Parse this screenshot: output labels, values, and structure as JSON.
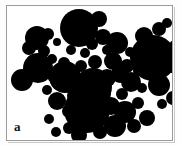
{
  "figure": {
    "panel_label": "a",
    "background_color": "#ffffff",
    "particle_color": "#000000",
    "frame_color": "#9a9a9a",
    "outer_background": "#fdfdfd",
    "frame": {
      "x": 6,
      "y": 5,
      "width": 167,
      "height": 136
    }
  },
  "chart_data": {
    "type": "scatter",
    "title": "",
    "subtitle": "",
    "xlabel": "",
    "ylabel": "",
    "xlim": [
      0,
      165
    ],
    "ylim": [
      0,
      134
    ],
    "grid": false,
    "legend": null,
    "annotations": [
      "a"
    ],
    "marker_color": "#000000",
    "count": 58,
    "series": [
      {
        "name": "particles",
        "fields": [
          "cx",
          "cy",
          "r"
        ],
        "points": [
          [
            72,
            22,
            19
          ],
          [
            92,
            13,
            8
          ],
          [
            96,
            31,
            8
          ],
          [
            85,
            38,
            6
          ],
          [
            100,
            44,
            5
          ],
          [
            110,
            37,
            11
          ],
          [
            106,
            55,
            9
          ],
          [
            120,
            60,
            7
          ],
          [
            30,
            32,
            12
          ],
          [
            41,
            28,
            6
          ],
          [
            22,
            42,
            7
          ],
          [
            37,
            45,
            6
          ],
          [
            45,
            53,
            5
          ],
          [
            31,
            62,
            15
          ],
          [
            15,
            74,
            11
          ],
          [
            46,
            70,
            6
          ],
          [
            57,
            57,
            6
          ],
          [
            58,
            71,
            16
          ],
          [
            137,
            30,
            9
          ],
          [
            152,
            23,
            7
          ],
          [
            160,
            17,
            5
          ],
          [
            146,
            52,
            23
          ],
          [
            123,
            46,
            5
          ],
          [
            168,
            40,
            6
          ],
          [
            164,
            60,
            7
          ],
          [
            152,
            79,
            11
          ],
          [
            166,
            92,
            7
          ],
          [
            135,
            82,
            5
          ],
          [
            124,
            76,
            10
          ],
          [
            113,
            68,
            9
          ],
          [
            100,
            72,
            9
          ],
          [
            86,
            81,
            19
          ],
          [
            68,
            90,
            8
          ],
          [
            50,
            95,
            9
          ],
          [
            80,
            104,
            23
          ],
          [
            104,
            100,
            9
          ],
          [
            118,
            106,
            11
          ],
          [
            131,
            97,
            6
          ],
          [
            140,
            112,
            8
          ],
          [
            127,
            120,
            7
          ],
          [
            108,
            120,
            11
          ],
          [
            93,
            126,
            7
          ],
          [
            72,
            129,
            8
          ],
          [
            62,
            122,
            6
          ],
          [
            49,
            126,
            5
          ],
          [
            42,
            113,
            5
          ],
          [
            64,
            44,
            5
          ],
          [
            50,
            36,
            4
          ],
          [
            88,
            56,
            7
          ],
          [
            74,
            60,
            6
          ],
          [
            131,
            65,
            5
          ],
          [
            96,
            88,
            8
          ],
          [
            62,
            105,
            7
          ],
          [
            25,
            54,
            5
          ],
          [
            40,
            84,
            5
          ],
          [
            155,
            98,
            5
          ],
          [
            115,
            88,
            6
          ],
          [
            78,
            47,
            5
          ]
        ]
      }
    ]
  }
}
